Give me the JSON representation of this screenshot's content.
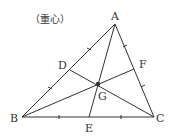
{
  "title": "（重心）",
  "points": {
    "A": {
      "label": "A",
      "x": 115,
      "y": 24
    },
    "B": {
      "label": "B",
      "x": 22,
      "y": 117
    },
    "C": {
      "label": "C",
      "x": 154,
      "y": 117
    },
    "D": {
      "label": "D",
      "x": 70,
      "y": 70
    },
    "E": {
      "label": "E",
      "x": 89,
      "y": 117
    },
    "F": {
      "label": "F",
      "x": 134,
      "y": 69
    },
    "G": {
      "label": "G",
      "x": 98,
      "y": 84
    }
  },
  "colors": {
    "line": "#333333"
  }
}
